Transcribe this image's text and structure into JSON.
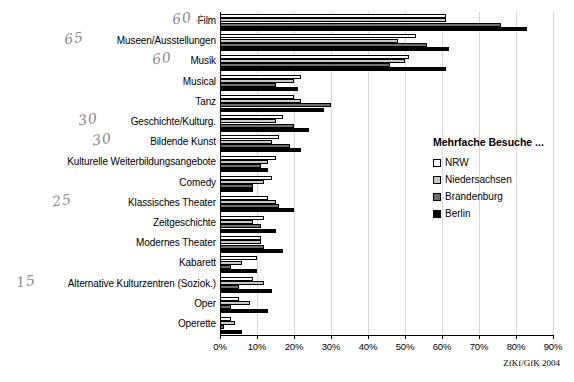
{
  "chart_data": {
    "type": "bar",
    "orientation": "horizontal",
    "title": "",
    "xlabel": "",
    "ylabel": "",
    "xlim": [
      0,
      90
    ],
    "grid": true,
    "legend_position": "right",
    "legend_title": "Mehrfache Besuche ...",
    "xticks": [
      "0%",
      "10%",
      "20%",
      "30%",
      "40%",
      "50%",
      "60%",
      "70%",
      "80%",
      "90%"
    ],
    "xtick_values": [
      0,
      10,
      20,
      30,
      40,
      50,
      60,
      70,
      80,
      90
    ],
    "categories": [
      "Film",
      "Museen/Ausstellungen",
      "Musik",
      "Musical",
      "Tanz",
      "Geschichte/Kulturg.",
      "Bildende Kunst",
      "Kulturelle Weiterbildungsangebote",
      "Comedy",
      "Klassisches Theater",
      "Zeitgeschichte",
      "Modernes Theater",
      "Kabarett",
      "Alternative Kulturzentren (Soziok.)",
      "Oper",
      "Operette"
    ],
    "series": [
      {
        "name": "NRW",
        "color": "#ffffff",
        "values": [
          61,
          53,
          51,
          22,
          20,
          17,
          16,
          15,
          14,
          13,
          12,
          11,
          10,
          9,
          5,
          3
        ]
      },
      {
        "name": "Niedersachsen",
        "color": "#c9c9c9",
        "values": [
          61,
          48,
          50,
          20,
          22,
          15,
          14,
          13,
          12,
          15,
          9,
          11,
          6,
          12,
          8,
          4
        ]
      },
      {
        "name": "Brandenburg",
        "color": "#6e6e6e",
        "values": [
          76,
          56,
          46,
          15,
          30,
          20,
          19,
          11,
          9,
          16,
          11,
          12,
          3,
          5,
          3,
          1
        ]
      },
      {
        "name": "Berlin",
        "color": "#000000",
        "values": [
          83,
          62,
          61,
          21,
          28,
          24,
          22,
          13,
          9,
          20,
          15,
          17,
          10,
          14,
          13,
          6
        ]
      }
    ],
    "source_note": "ZfKf/GfK 2004"
  },
  "annotations": {
    "handwritten": [
      {
        "text": "60",
        "category": "Film"
      },
      {
        "text": "65",
        "category": "Museen/Ausstellungen"
      },
      {
        "text": "60",
        "category": "Musik"
      },
      {
        "text": "30",
        "category": "Geschichte/Kulturg."
      },
      {
        "text": "30",
        "category": "Bildende Kunst"
      },
      {
        "text": "25",
        "category": "Klassisches Theater"
      },
      {
        "text": "15",
        "category": "Alternative Kulturzentren (Soziok.)"
      }
    ],
    "check_mark": "✓"
  }
}
